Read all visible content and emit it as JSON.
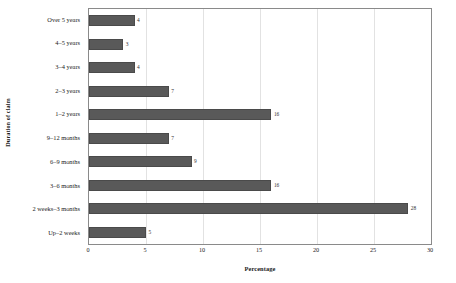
{
  "chart_data": {
    "type": "bar",
    "orientation": "horizontal",
    "title": "",
    "xlabel": "Percentage",
    "ylabel": "Duration of claim",
    "categories": [
      "Over 5 years",
      "4–5 years",
      "3–4 years",
      "2–3 years",
      "1–2 years",
      "9–12 months",
      "6–9 months",
      "3–6 months",
      "2 weeks–3 months",
      "Up–2 weeks"
    ],
    "values": [
      4,
      3,
      4,
      7,
      16,
      7,
      9,
      16,
      28,
      5
    ],
    "data_labels": [
      "4",
      "3",
      "4",
      "7",
      "16",
      "7",
      "9",
      "16",
      "28",
      "5"
    ],
    "xlim": [
      0,
      30
    ],
    "xticks": [
      0,
      5,
      10,
      15,
      20,
      25,
      30
    ],
    "xtick_labels": [
      "0",
      "5",
      "10",
      "15",
      "20",
      "25",
      "30"
    ],
    "grid": "vertical-light",
    "legend": "none",
    "bar_color": "#595959",
    "frame_color": "#8a8a8a",
    "gridline_color": "#e2e2e2"
  }
}
